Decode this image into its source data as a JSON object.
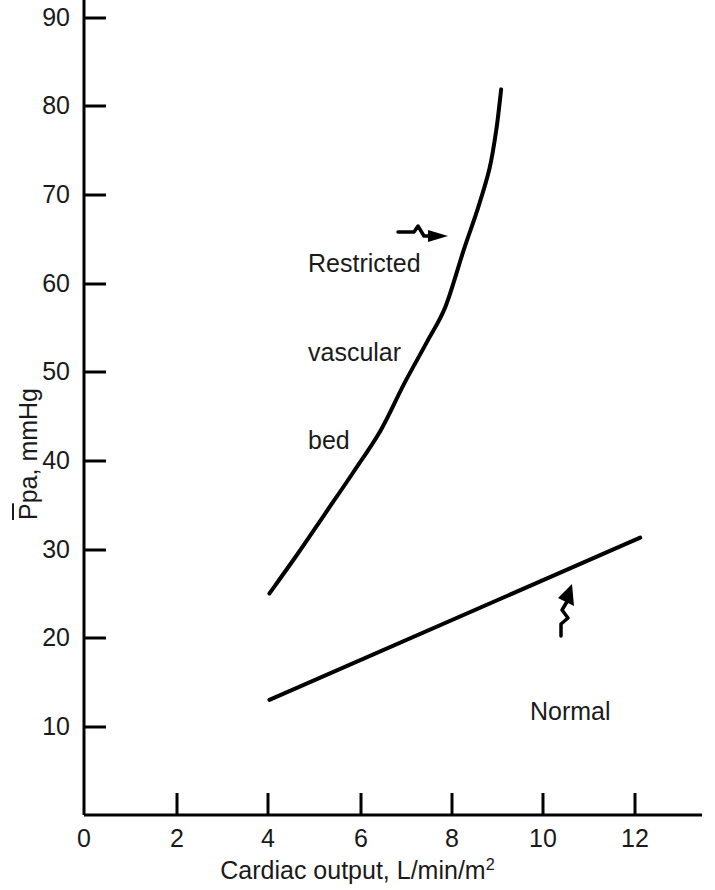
{
  "figure": {
    "background_color": "#ffffff",
    "ink_color": "#000000"
  },
  "chart_data": {
    "type": "line",
    "title": "",
    "subtitle": "",
    "xlabel": "Cardiac output, L/min/m",
    "xlabel_superscript": "2",
    "ylabel_prefix": "P",
    "ylabel_rest": "pa, mmHg",
    "ylabel_full": "P̄pa, mmHg",
    "xlim": [
      0,
      14.3
    ],
    "ylim": [
      0,
      94
    ],
    "xticks": [
      0,
      2,
      4,
      6,
      8,
      10,
      12
    ],
    "xtick_labels": [
      "0",
      "2",
      "4",
      "6",
      "8",
      "10",
      "12"
    ],
    "yticks": [
      10,
      20,
      30,
      40,
      50,
      60,
      70,
      80,
      90
    ],
    "ytick_labels": [
      "10",
      "20",
      "30",
      "40",
      "50",
      "60",
      "70",
      "80",
      "90"
    ],
    "grid": false,
    "legend_position": "none",
    "axis_style": "left-and-bottom-spine",
    "series": [
      {
        "name": "Restricted vascular bed",
        "style": "solid",
        "line_width": 4,
        "color": "#000000",
        "points": [
          [
            4.0,
            25.0
          ],
          [
            4.6,
            29.4
          ],
          [
            5.2,
            34.0
          ],
          [
            5.8,
            38.6
          ],
          [
            6.4,
            43.4
          ],
          [
            6.9,
            48.6
          ],
          [
            7.4,
            53.4
          ],
          [
            7.8,
            57.4
          ],
          [
            8.2,
            63.9
          ],
          [
            8.5,
            68.5
          ],
          [
            8.75,
            73.0
          ],
          [
            8.9,
            77.5
          ],
          [
            9.0,
            81.9
          ]
        ]
      },
      {
        "name": "Normal",
        "style": "solid",
        "line_width": 4,
        "color": "#000000",
        "points": [
          [
            4.0,
            13.0
          ],
          [
            12.0,
            31.3
          ]
        ]
      }
    ],
    "annotations": [
      {
        "name": "restricted-vascular-bed",
        "text_lines": [
          "Restricted",
          "vascular",
          "bed"
        ],
        "text": "Restricted vascular bed",
        "arrow": "wavy-arrow-right",
        "points_to_series": "Restricted vascular bed"
      },
      {
        "name": "normal",
        "text_lines": [
          "Normal"
        ],
        "text": "Normal",
        "arrow": "wavy-arrow-up-left",
        "points_to_series": "Normal"
      }
    ]
  }
}
